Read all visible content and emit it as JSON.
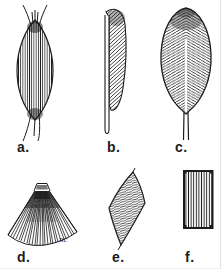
{
  "canvas": {
    "background": "#ffffff",
    "ink": "#1c1c1c"
  },
  "figures": [
    {
      "id": "a",
      "label": "a.",
      "shape": "fusiform-spindle-muscle"
    },
    {
      "id": "b",
      "label": "b.",
      "shape": "unipennate-half-feather-muscle"
    },
    {
      "id": "c",
      "label": "c.",
      "shape": "bipennate-feather-muscle"
    },
    {
      "id": "d",
      "label": "d.",
      "shape": "fan-convergent-muscle"
    },
    {
      "id": "e",
      "label": "e.",
      "shape": "rhomboid-flat-muscle"
    },
    {
      "id": "f",
      "label": "f.",
      "shape": "quadrate-rectangular-muscle"
    }
  ],
  "signature": "nc"
}
